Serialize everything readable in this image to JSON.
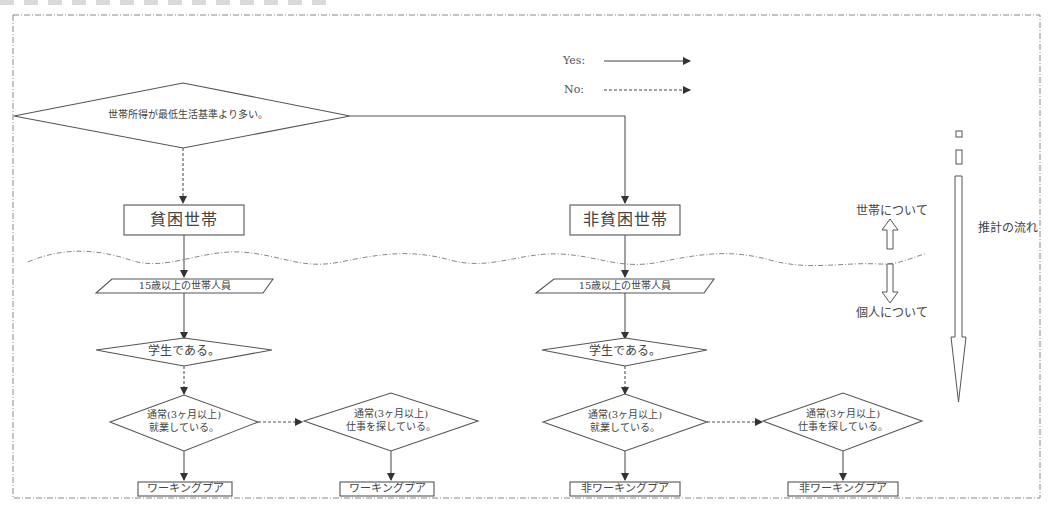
{
  "legend": {
    "yes_label": "Yes:",
    "no_label": "No:"
  },
  "top_decision": {
    "text": "世帯所得が最低生活基準より多い。"
  },
  "households": {
    "poor": "貧困世帯",
    "non_poor": "非貧困世帯"
  },
  "members": {
    "left": "15歳以上の世帯人員",
    "right": "15歳以上の世帯人員"
  },
  "student_decision": {
    "left": "学生である。",
    "right": "学生である。"
  },
  "employed_decision": {
    "left_line1": "通常(3ヶ月以上)",
    "left_line2": "就業している。",
    "right_line1": "通常(3ヶ月以上)",
    "right_line2": "就業している。"
  },
  "seeking_decision": {
    "left_line1": "通常(3ヶ月以上)",
    "left_line2": "仕事を探している。",
    "right_line1": "通常(3ヶ月以上)",
    "right_line2": "仕事を探している。"
  },
  "outcomes": {
    "left_employed": "ワーキングプア",
    "left_seeking": "ワーキングプア",
    "right_employed": "非ワーキングプア",
    "right_seeking": "非ワーキングプア"
  },
  "levels": {
    "household": "世帯について",
    "individual": "個人について"
  },
  "flow_label": "推計の流れ",
  "colors": {
    "stroke": "#555555",
    "frame": "#777777",
    "background": "#ffffff"
  }
}
